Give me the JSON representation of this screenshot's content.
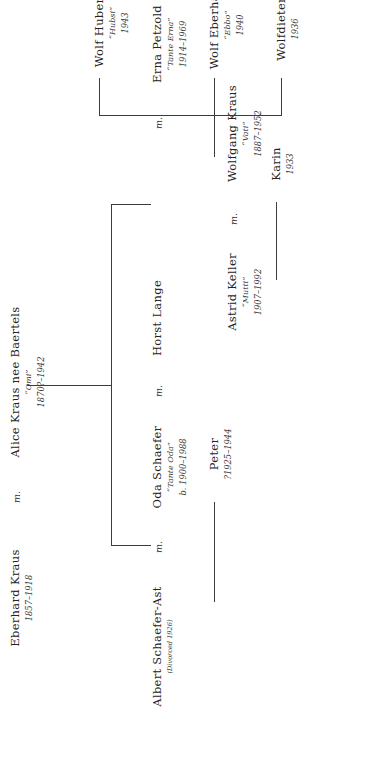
{
  "document": {
    "kind": "genealogy-chart",
    "orientation": "rotated-90-ccw",
    "ink_color": "#3b3b3b",
    "paper_color": "#ffffff"
  },
  "generations": {
    "g1": {
      "label": "grandparents",
      "husband": {
        "name": "Eberhard Kraus",
        "nickname": "",
        "dates": "1857–1918",
        "note": ""
      },
      "marriage_mark": "m.",
      "wife": {
        "name": "Alice Kraus nee Baertels",
        "nickname": "“Omi”",
        "dates": "1870?–1942",
        "note": ""
      }
    },
    "g2": {
      "label": "children-of-g1",
      "people": [
        {
          "id": "oda-couple-ex",
          "name": "Albert Schaefer-Ast",
          "nickname": "",
          "dates": "",
          "note": "(Divorced 1926)"
        },
        {
          "id": "oda",
          "name": "Oda Schaefer",
          "nickname": "“Tante Oda”",
          "dates": "b. 1900–1988",
          "note": ""
        },
        {
          "id": "horst",
          "name": "Horst Lange",
          "nickname": "",
          "dates": "",
          "note": ""
        },
        {
          "id": "astrid",
          "name": "Astrid Keller",
          "nickname": "“Mutti”",
          "dates": "1907–1992",
          "note": ""
        },
        {
          "id": "wolfgang",
          "name": "Wolfgang Kraus",
          "nickname": "“Vati”",
          "dates": "1887–1952",
          "note": ""
        },
        {
          "id": "erna",
          "name": "Erna Petzold",
          "nickname": "“Tante Erna”",
          "dates": "1914–1969",
          "note": ""
        }
      ],
      "marriage_marks": [
        "m.",
        "m.",
        "m.",
        "m."
      ]
    },
    "g3": {
      "label": "grandchildren",
      "people": [
        {
          "id": "peter",
          "name": "Peter",
          "nickname": "",
          "dates": "?1925–1944",
          "note": ""
        },
        {
          "id": "karin",
          "name": "Karin",
          "nickname": "",
          "dates": "1933",
          "note": ""
        },
        {
          "id": "wolfdieter",
          "name": "Wolfdieter",
          "nickname": "",
          "dates": "1936",
          "note": ""
        },
        {
          "id": "wolf-eberhard",
          "name": "Wolf Eberhard",
          "nickname": "“Ebbo”",
          "dates": "1940",
          "note": ""
        },
        {
          "id": "wolf-hubertus",
          "name": "Wolf Hubertus",
          "nickname": "“Hubsi”",
          "dates": "1943",
          "note": ""
        }
      ]
    }
  }
}
